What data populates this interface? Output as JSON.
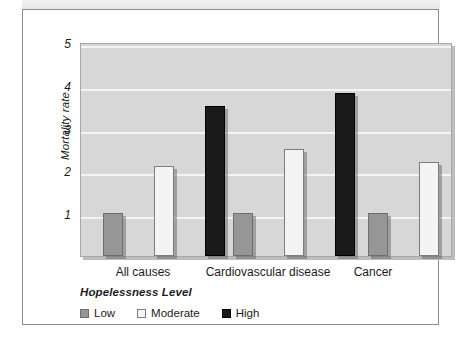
{
  "figure": {
    "frame_border_color": "#8d8d8d",
    "plot_background": "#d7d7d7",
    "gridline_color": "#f4f4f4"
  },
  "chart_data": {
    "type": "bar",
    "title": "",
    "xlabel": "",
    "ylabel": "Mortality rate",
    "categories": [
      "All causes",
      "Cardiovascular disease",
      "Cancer"
    ],
    "series": [
      {
        "name": "Low",
        "color": "#969696",
        "values": [
          1.0,
          1.0,
          1.0
        ]
      },
      {
        "name": "Moderate",
        "color": "#f4f4f4",
        "values": [
          2.1,
          2.5,
          2.2
        ]
      },
      {
        "name": "High",
        "color": "#1a1a1a",
        "values": [
          3.5,
          3.8,
          2.7
        ]
      }
    ],
    "ylim": [
      0,
      5
    ],
    "yticks": [
      "1",
      "2",
      "3",
      "4",
      "5"
    ],
    "ytick_values": [
      1,
      2,
      3,
      4,
      5
    ],
    "grid": true,
    "legend_position": "below-axes-left"
  },
  "legend": {
    "title": "Hopelessness Level",
    "items": [
      {
        "label": "Low",
        "swatch": "low-swatch"
      },
      {
        "label": "Moderate",
        "swatch": "moderate-swatch"
      },
      {
        "label": "High",
        "swatch": "high-swatch"
      }
    ]
  }
}
